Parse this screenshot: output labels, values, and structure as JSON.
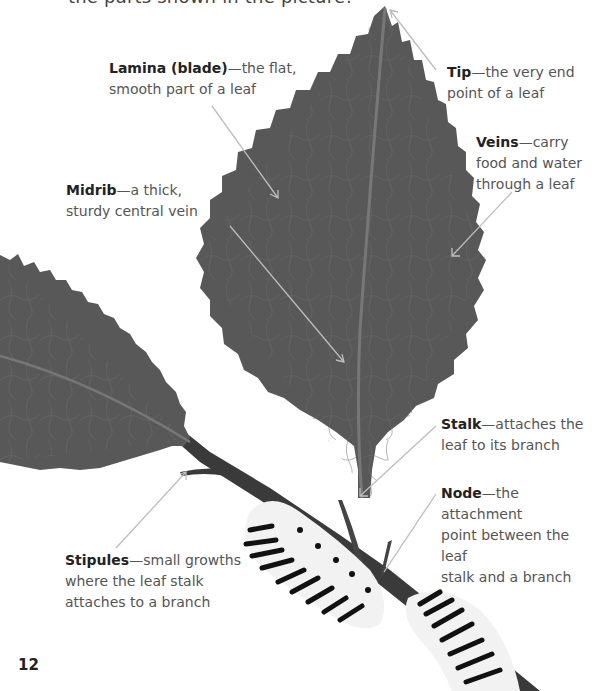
{
  "intro_text": "the parts shown in the picture!",
  "page_number": "12",
  "colors": {
    "leaf": "#585858",
    "vein": "#707070",
    "branch": "#3a3a3a",
    "pointer_line": "#bdbdbd",
    "caterpillar_body": "#f2f2f2",
    "caterpillar_stripes": "#111111"
  },
  "labels": [
    {
      "id": "lamina",
      "term": "Lamina (blade)",
      "desc_line1": "—the flat,",
      "desc_line2": "smooth part of a leaf",
      "desc_line3": ""
    },
    {
      "id": "tip",
      "term": "Tip",
      "desc_line1": "—the very end",
      "desc_line2": "point of a leaf",
      "desc_line3": ""
    },
    {
      "id": "veins",
      "term": "Veins",
      "desc_line1": "—carry",
      "desc_line2": "food and water",
      "desc_line3": "through a leaf"
    },
    {
      "id": "midrib",
      "term": "Midrib",
      "desc_line1": "—a thick,",
      "desc_line2": "sturdy central vein",
      "desc_line3": ""
    },
    {
      "id": "stalk",
      "term": "Stalk",
      "desc_line1": "—attaches the",
      "desc_line2": "leaf to its branch",
      "desc_line3": ""
    },
    {
      "id": "node",
      "term": "Node",
      "desc_line1": "—the attachment",
      "desc_line2": "point between the leaf",
      "desc_line3": "stalk and a branch"
    },
    {
      "id": "stipules",
      "term": "Stipules",
      "desc_line1": "—small growths",
      "desc_line2": "where the leaf stalk",
      "desc_line3": "attaches to a branch"
    }
  ]
}
